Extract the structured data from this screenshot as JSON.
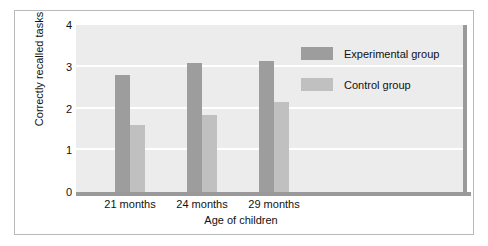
{
  "chart_data": {
    "type": "bar",
    "title": "",
    "xlabel": "Age of children",
    "ylabel": "Correctly recalled tasks",
    "categories": [
      "21 months",
      "24 months",
      "29 months"
    ],
    "series": [
      {
        "name": "Experimental group",
        "color": "#9d9d9d",
        "values": [
          2.8,
          3.1,
          3.15
        ]
      },
      {
        "name": "Control group",
        "color": "#c0c0c0",
        "values": [
          1.6,
          1.85,
          2.15
        ]
      }
    ],
    "ylim": [
      0,
      4
    ],
    "yticks": [
      "4",
      "3",
      "2",
      "1",
      "0"
    ],
    "ytick_values": [
      4,
      3,
      2,
      1,
      0
    ],
    "grid": true,
    "legend_position": "top-right",
    "plot_background": "#ececec"
  },
  "legend": {
    "items": [
      {
        "label": "Experimental group",
        "swatch": "#9d9d9d"
      },
      {
        "label": "Control group",
        "swatch": "#c0c0c0"
      }
    ]
  }
}
